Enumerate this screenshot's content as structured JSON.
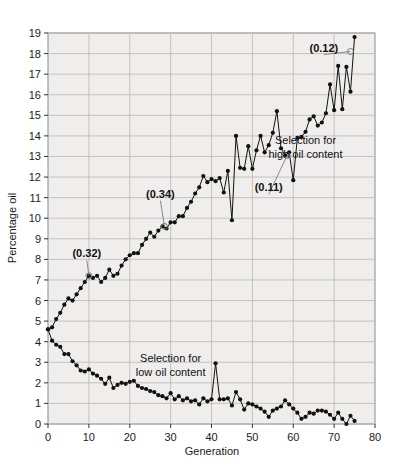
{
  "chart_data": {
    "type": "line",
    "title": "",
    "xlabel": "Generation",
    "ylabel": "Percentage oil",
    "xlim": [
      0,
      80
    ],
    "ylim": [
      0,
      19
    ],
    "xticks": [
      0,
      10,
      20,
      30,
      40,
      50,
      60,
      70,
      80
    ],
    "yticks": [
      0,
      1,
      2,
      3,
      4,
      5,
      6,
      7,
      8,
      9,
      10,
      11,
      12,
      13,
      14,
      15,
      16,
      17,
      18,
      19
    ],
    "grid": true,
    "legend_position": "inline-annotations",
    "plot_background": "#efeeec",
    "line_color": "#111111",
    "marker": "filled-circle",
    "series": [
      {
        "name": "Selection for high oil content",
        "x": [
          0,
          1,
          2,
          3,
          4,
          5,
          6,
          7,
          8,
          9,
          10,
          11,
          12,
          13,
          14,
          15,
          16,
          17,
          18,
          19,
          20,
          21,
          22,
          23,
          24,
          25,
          26,
          27,
          28,
          29,
          30,
          31,
          32,
          33,
          34,
          35,
          36,
          37,
          38,
          39,
          40,
          41,
          42,
          43,
          44,
          45,
          46,
          47,
          48,
          49,
          50,
          51,
          52,
          53,
          54,
          55,
          56,
          57,
          58,
          59,
          60,
          61,
          62,
          63,
          64,
          65,
          66,
          67,
          68,
          69,
          70,
          71,
          72,
          73,
          74,
          75
        ],
        "values": [
          4.6,
          4.7,
          5.1,
          5.4,
          5.8,
          6.1,
          6.0,
          6.3,
          6.6,
          6.9,
          7.2,
          7.1,
          7.2,
          6.9,
          7.1,
          7.5,
          7.2,
          7.3,
          7.7,
          8.0,
          8.2,
          8.3,
          8.3,
          8.7,
          9.0,
          9.3,
          9.1,
          9.4,
          9.6,
          9.5,
          9.8,
          9.8,
          10.1,
          10.1,
          10.5,
          10.8,
          11.2,
          11.5,
          12.05,
          11.75,
          11.9,
          11.8,
          11.95,
          11.25,
          12.3,
          9.9,
          14.0,
          12.45,
          12.4,
          13.5,
          12.4,
          13.3,
          14.0,
          13.2,
          13.55,
          14.15,
          15.2,
          13.4,
          13.05,
          13.2,
          11.85,
          13.9,
          13.95,
          14.2,
          14.8,
          14.95,
          14.5,
          14.65,
          15.1,
          16.5,
          15.25,
          17.4,
          15.3,
          17.35,
          16.15,
          18.8
        ]
      },
      {
        "name": "Selection for low oil content",
        "x": [
          0,
          1,
          2,
          3,
          4,
          5,
          6,
          7,
          8,
          9,
          10,
          11,
          12,
          13,
          14,
          15,
          16,
          17,
          18,
          19,
          20,
          21,
          22,
          23,
          24,
          25,
          26,
          27,
          28,
          29,
          30,
          31,
          32,
          33,
          34,
          35,
          36,
          37,
          38,
          39,
          40,
          41,
          42,
          43,
          44,
          45,
          46,
          47,
          48,
          49,
          50,
          51,
          52,
          53,
          54,
          55,
          56,
          57,
          58,
          59,
          60,
          61,
          62,
          63,
          64,
          65,
          66,
          67,
          68,
          69,
          70,
          71,
          72,
          73,
          74,
          75
        ],
        "values": [
          4.6,
          4.05,
          3.85,
          3.75,
          3.4,
          3.4,
          3.05,
          2.85,
          2.6,
          2.55,
          2.65,
          2.45,
          2.35,
          2.2,
          1.95,
          2.25,
          1.75,
          1.9,
          2.0,
          1.95,
          2.05,
          2.1,
          1.85,
          1.75,
          1.7,
          1.6,
          1.55,
          1.4,
          1.35,
          1.25,
          1.5,
          1.2,
          1.35,
          1.15,
          1.25,
          1.1,
          1.15,
          0.95,
          1.25,
          1.1,
          1.2,
          2.95,
          1.2,
          1.2,
          1.25,
          0.9,
          1.55,
          1.2,
          0.7,
          1.0,
          0.95,
          0.85,
          0.75,
          0.6,
          0.35,
          0.65,
          0.75,
          0.85,
          1.15,
          0.95,
          0.75,
          0.55,
          0.25,
          0.35,
          0.55,
          0.5,
          0.65,
          0.65,
          0.6,
          0.45,
          0.25,
          0.55,
          0.25,
          0.0,
          0.4,
          0.15
        ]
      }
    ],
    "annotations": [
      {
        "label": "(0.32)",
        "text_x": 9.5,
        "text_y": 8.1,
        "point_x": 10.0,
        "point_y": 7.2
      },
      {
        "label": "(0.34)",
        "text_x": 27.5,
        "text_y": 11.0,
        "point_x": 28.5,
        "point_y": 9.6
      },
      {
        "label": "(0.11)",
        "text_x": 54.0,
        "text_y": 11.3,
        "point_x": 58.5,
        "point_y": 13.05
      },
      {
        "label": "(0.12)",
        "text_x": 67.5,
        "text_y": 18.1,
        "point_x": 74.0,
        "point_y": 18.1
      }
    ],
    "series_labels": [
      {
        "text_line1": "Selection for",
        "text_line2": "high oil content",
        "x": 63.0,
        "y": 13.6
      },
      {
        "text_line1": "Selection for",
        "text_line2": "low oil content",
        "x": 30.0,
        "y": 3.0
      }
    ]
  }
}
